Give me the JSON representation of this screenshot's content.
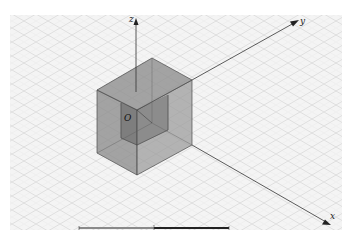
{
  "diagram": {
    "type": "3d-isometric-coordinate-view",
    "axes": [
      {
        "name": "z",
        "label": "z"
      },
      {
        "name": "y",
        "label": "y"
      },
      {
        "name": "x",
        "label": "x"
      }
    ],
    "origin_label": "O",
    "objects": [
      {
        "name": "outer-cube",
        "description": "semi-transparent gray box"
      },
      {
        "name": "inner-cube",
        "description": "darker inner box at origin"
      }
    ],
    "background": "isometric-grid",
    "scale_bar": {
      "segments": 2
    }
  },
  "colors": {
    "grid_background": "#f3f3f3",
    "grid_lines": "#d2d2d2",
    "axis": "#333333",
    "outer_cube_face": "#8a8a8a",
    "inner_cube_face": "#5e5e5e",
    "edge": "#4a4a4a"
  }
}
